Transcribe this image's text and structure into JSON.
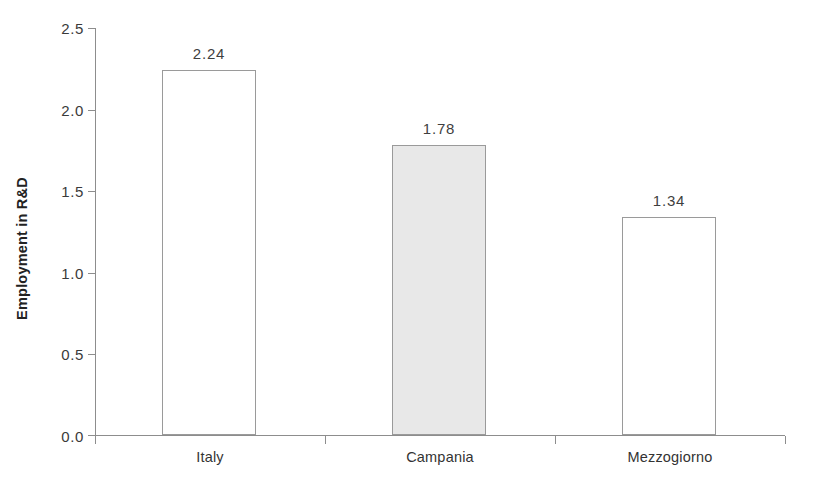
{
  "chart_data": {
    "type": "bar",
    "title": "",
    "subtitle": "",
    "xlabel": "",
    "ylabel": "Employment in R&D",
    "categories": [
      "Italy",
      "Campania",
      "Mezzogiorno"
    ],
    "values": [
      2.24,
      1.78,
      1.34
    ],
    "value_labels": [
      "2.24",
      "1.78",
      "1.34"
    ],
    "ylim": [
      0.0,
      2.5
    ],
    "ytick_labels": [
      "0.0",
      "0.5",
      "1.0",
      "1.5",
      "2.0",
      "2.5"
    ],
    "ytick_values": [
      0.0,
      0.5,
      1.0,
      1.5,
      2.0,
      2.5
    ],
    "grid": false,
    "legend": false,
    "legend_position": "none",
    "series": [
      {
        "name": "Employment in R&D",
        "values": [
          2.24,
          1.78,
          1.34
        ]
      }
    ],
    "bar_styles": [
      {
        "category": "Italy",
        "fill": "#ffffff",
        "stroke": "#9a9a9a"
      },
      {
        "category": "Campania",
        "fill": "#e8e8e8",
        "stroke": "#9a9a9a"
      },
      {
        "category": "Mezzogiorno",
        "fill": "#ffffff",
        "stroke": "#9a9a9a"
      }
    ],
    "colors": {
      "axis": "#8d8d8d",
      "text": "#333333",
      "bar_default_fill": "#ffffff",
      "bar_highlight_fill": "#e8e8e8",
      "bar_stroke": "#9a9a9a"
    }
  }
}
